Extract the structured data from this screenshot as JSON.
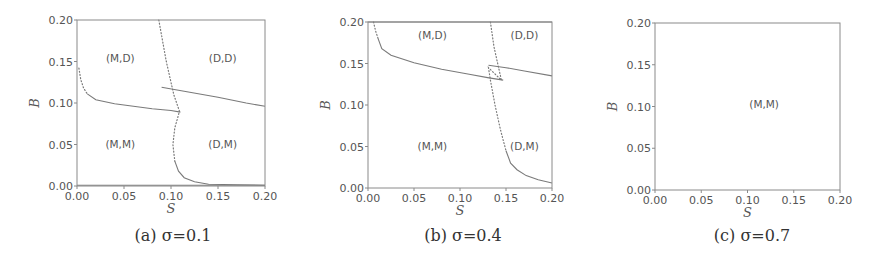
{
  "figure": {
    "width": 881,
    "height": 270,
    "line_color": "#7a7a7a",
    "frame_color": "#8a8a8a",
    "text_color": "#555555"
  },
  "chart_data": [
    {
      "type": "line",
      "caption": "(a) σ=0.1",
      "xlabel": "S",
      "ylabel": "B",
      "xlim": [
        0.0,
        0.2
      ],
      "ylim": [
        0.0,
        0.2
      ],
      "xticks": [
        "0.00",
        "0.05",
        "0.10",
        "0.15",
        "0.20"
      ],
      "yticks": [
        "0.00",
        "0.05",
        "0.10",
        "0.15",
        "0.20"
      ],
      "frame_px": {
        "x0": 77,
        "x1": 265,
        "y0": 186,
        "y1": 20
      },
      "region_labels": [
        {
          "text": "(M,D)",
          "x": 0.046,
          "y": 0.154
        },
        {
          "text": "(D,D)",
          "x": 0.155,
          "y": 0.154
        },
        {
          "text": "(M,M)",
          "x": 0.046,
          "y": 0.051
        },
        {
          "text": "(D,M)",
          "x": 0.155,
          "y": 0.051
        }
      ],
      "series": [
        {
          "name": "left-boundary-dotted",
          "style": "dotted",
          "points": [
            [
              0.002,
              0.142
            ],
            [
              0.004,
              0.128
            ],
            [
              0.007,
              0.118
            ],
            [
              0.011,
              0.111
            ]
          ]
        },
        {
          "name": "left-boundary",
          "style": "solid",
          "points": [
            [
              0.011,
              0.111
            ],
            [
              0.02,
              0.104
            ],
            [
              0.04,
              0.099
            ],
            [
              0.06,
              0.096
            ],
            [
              0.08,
              0.093
            ],
            [
              0.1,
              0.091
            ],
            [
              0.11,
              0.089
            ]
          ]
        },
        {
          "name": "right-boundary",
          "style": "solid",
          "points": [
            [
              0.09,
              0.119
            ],
            [
              0.12,
              0.113
            ],
            [
              0.15,
              0.107
            ],
            [
              0.18,
              0.1
            ],
            [
              0.2,
              0.096
            ]
          ]
        },
        {
          "name": "vertical-boundary-dotted",
          "style": "dotted",
          "points": [
            [
              0.087,
              0.2
            ],
            [
              0.095,
              0.15
            ],
            [
              0.103,
              0.11
            ],
            [
              0.109,
              0.09
            ],
            [
              0.104,
              0.07
            ],
            [
              0.102,
              0.05
            ],
            [
              0.104,
              0.03
            ]
          ]
        },
        {
          "name": "vertical-boundary-tail",
          "style": "solid",
          "points": [
            [
              0.104,
              0.03
            ],
            [
              0.108,
              0.018
            ],
            [
              0.114,
              0.01
            ],
            [
              0.125,
              0.005
            ],
            [
              0.14,
              0.002
            ],
            [
              0.17,
              0.0015
            ],
            [
              0.2,
              0.001
            ]
          ]
        },
        {
          "name": "bottom-line",
          "style": "solid",
          "points": [
            [
              0.0,
              0.001
            ],
            [
              0.2,
              0.001
            ]
          ]
        }
      ]
    },
    {
      "type": "line",
      "caption": "(b) σ=0.4",
      "xlabel": "S",
      "ylabel": "B",
      "xlim": [
        0.0,
        0.2
      ],
      "ylim": [
        0.0,
        0.2
      ],
      "xticks": [
        "0.00",
        "0.05",
        "0.10",
        "0.15",
        "0.20"
      ],
      "yticks": [
        "0.00",
        "0.05",
        "0.10",
        "0.15",
        "0.20"
      ],
      "frame_px": {
        "x0": 368,
        "x1": 552,
        "y0": 188,
        "y1": 22
      },
      "region_labels": [
        {
          "text": "(M,D)",
          "x": 0.07,
          "y": 0.184
        },
        {
          "text": "(D,D)",
          "x": 0.17,
          "y": 0.184
        },
        {
          "text": "(M,M)",
          "x": 0.07,
          "y": 0.051
        },
        {
          "text": "(D,M)",
          "x": 0.17,
          "y": 0.051
        }
      ],
      "series": [
        {
          "name": "left-boundary-dotted",
          "style": "dotted",
          "points": [
            [
              0.006,
              0.2
            ],
            [
              0.008,
              0.19
            ],
            [
              0.011,
              0.18
            ]
          ]
        },
        {
          "name": "left-boundary",
          "style": "solid",
          "points": [
            [
              0.011,
              0.18
            ],
            [
              0.015,
              0.168
            ],
            [
              0.025,
              0.16
            ],
            [
              0.05,
              0.151
            ],
            [
              0.08,
              0.143
            ],
            [
              0.11,
              0.137
            ],
            [
              0.13,
              0.133
            ],
            [
              0.147,
              0.13
            ]
          ]
        },
        {
          "name": "right-boundary",
          "style": "solid",
          "points": [
            [
              0.131,
              0.148
            ],
            [
              0.15,
              0.145
            ],
            [
              0.17,
              0.141
            ],
            [
              0.2,
              0.135
            ]
          ]
        },
        {
          "name": "vertical-boundary-dotted",
          "style": "dotted",
          "points": [
            [
              0.133,
              0.2
            ],
            [
              0.137,
              0.17
            ],
            [
              0.142,
              0.145
            ],
            [
              0.145,
              0.13
            ],
            [
              0.131,
              0.145
            ],
            [
              0.133,
              0.13
            ],
            [
              0.138,
              0.1
            ],
            [
              0.144,
              0.07
            ],
            [
              0.15,
              0.045
            ]
          ]
        },
        {
          "name": "vertical-boundary-tail",
          "style": "solid",
          "points": [
            [
              0.15,
              0.045
            ],
            [
              0.155,
              0.03
            ],
            [
              0.162,
              0.022
            ],
            [
              0.172,
              0.015
            ],
            [
              0.185,
              0.01
            ],
            [
              0.2,
              0.006
            ]
          ]
        },
        {
          "name": "top-line",
          "style": "solid",
          "points": [
            [
              0.0,
              0.2
            ],
            [
              0.2,
              0.2
            ]
          ]
        }
      ]
    },
    {
      "type": "line",
      "caption": "(c) σ=0.7",
      "xlabel": "S",
      "ylabel": "B",
      "xlim": [
        0.0,
        0.2
      ],
      "ylim": [
        0.0,
        0.2
      ],
      "xticks": [
        "0.00",
        "0.05",
        "0.10",
        "0.15",
        "0.20"
      ],
      "yticks": [
        "0.00",
        "0.05",
        "0.10",
        "0.15",
        "0.20"
      ],
      "frame_px": {
        "x0": 655,
        "x1": 840,
        "y0": 190,
        "y1": 23
      },
      "region_labels": [
        {
          "text": "(M,M)",
          "x": 0.118,
          "y": 0.103
        }
      ],
      "series": []
    }
  ]
}
